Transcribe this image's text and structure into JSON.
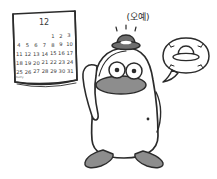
{
  "scene": {
    "title": "Penguin celebrating December with new hat",
    "background_color": "#ffffff",
    "ink_color": "#2b2b2b",
    "gray_color": "#8d8d8d"
  },
  "calendar": {
    "month_label": "12",
    "weeks": [
      [
        "",
        "",
        "",
        "",
        "1",
        "2",
        "3"
      ],
      [
        "4",
        "5",
        "6",
        "7",
        "8",
        "9",
        "10"
      ],
      [
        "11",
        "12",
        "13",
        "14",
        "15",
        "16",
        "17"
      ],
      [
        "18",
        "19",
        "20",
        "21",
        "22",
        "23",
        "24"
      ],
      [
        "25",
        "26",
        "27",
        "28",
        "29",
        "30",
        "31"
      ]
    ],
    "note": "merry"
  },
  "character": {
    "speech": "(오예)",
    "hat_color": "#6e6e6e",
    "beak_color": "#8d8d8d",
    "feet_color": "#8d8d8d"
  },
  "thought_bubble": {
    "contents": "hat",
    "sparkle_count": 4
  }
}
